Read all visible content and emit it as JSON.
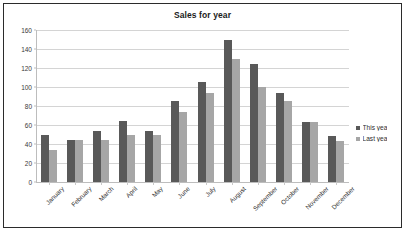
{
  "frame": {
    "border_color": "#2b2b2b",
    "background": "#ffffff"
  },
  "chart_data": {
    "type": "bar",
    "title": "Sales for year",
    "xlabel": "",
    "ylabel": "",
    "ylim": [
      0,
      160
    ],
    "ytick_step": 20,
    "yticks": [
      160,
      140,
      120,
      100,
      80,
      60,
      40,
      20,
      0
    ],
    "grid": true,
    "legend_position": "right",
    "categories": [
      "January",
      "February",
      "March",
      "April",
      "May",
      "June",
      "July",
      "August",
      "September",
      "October",
      "November",
      "December"
    ],
    "series": [
      {
        "name": "This yea",
        "color": "#595959",
        "values": [
          49,
          44,
          54,
          64,
          54,
          85,
          105,
          150,
          124,
          94,
          63,
          48
        ]
      },
      {
        "name": "Last yea",
        "color": "#a6a6a6",
        "values": [
          34,
          44,
          44,
          49,
          49,
          74,
          94,
          129,
          100,
          85,
          63,
          43
        ]
      }
    ]
  }
}
